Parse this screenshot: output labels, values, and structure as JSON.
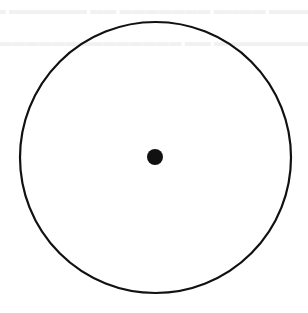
{
  "diagram": {
    "type": "geometry",
    "canvas": {
      "width": 308,
      "height": 313
    },
    "circle": {
      "cx": 155.5,
      "cy": 157.5,
      "r": 135.5,
      "stroke": "#111111",
      "stroke_width": 2.2,
      "fill": "none"
    },
    "center_point": {
      "cx": 155,
      "cy": 157,
      "r": 8,
      "fill": "#111111"
    },
    "background": "#ffffff"
  }
}
